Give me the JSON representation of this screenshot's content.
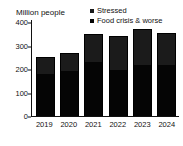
{
  "chart_data": {
    "type": "bar",
    "subtype": "stacked-vertical",
    "title": "",
    "ylabel": "Million people",
    "xlabel": "",
    "categories": [
      "2019",
      "2020",
      "2021",
      "2022",
      "2023",
      "2024"
    ],
    "series": [
      {
        "name": "Food crisis & worse",
        "color": "#050505",
        "values": [
          180,
          193,
          230,
          194,
          215,
          218
        ]
      },
      {
        "name": "Stressed",
        "color": "#1b1b1b",
        "values": [
          70,
          74,
          118,
          145,
          157,
          137
        ]
      }
    ],
    "totals": [
      250,
      267,
      348,
      339,
      372,
      355
    ],
    "ylim": [
      0,
      400
    ],
    "yticks": [
      0,
      100,
      200,
      300,
      400
    ],
    "ytick_labels": [
      "0",
      "100",
      "200",
      "300",
      "400"
    ],
    "grid": false,
    "legend_position": "top-right",
    "legend": [
      {
        "label": "Stressed",
        "swatch": "#1b1b1b"
      },
      {
        "label": "Food crisis & worse",
        "swatch": "#050505"
      }
    ]
  },
  "axis": {
    "y_title": "Million people",
    "y_ticks": [
      {
        "label": "400",
        "value": 400
      },
      {
        "label": "300",
        "value": 300
      },
      {
        "label": "200",
        "value": 200
      },
      {
        "label": "100",
        "value": 100
      },
      {
        "label": "0",
        "value": 0
      }
    ],
    "x_ticks": [
      "2019",
      "2020",
      "2021",
      "2022",
      "2023",
      "2024"
    ]
  },
  "colors": {
    "stressed": "#1b1b1b",
    "crisis": "#050505",
    "axis": "#111111",
    "background": "#ffffff"
  }
}
